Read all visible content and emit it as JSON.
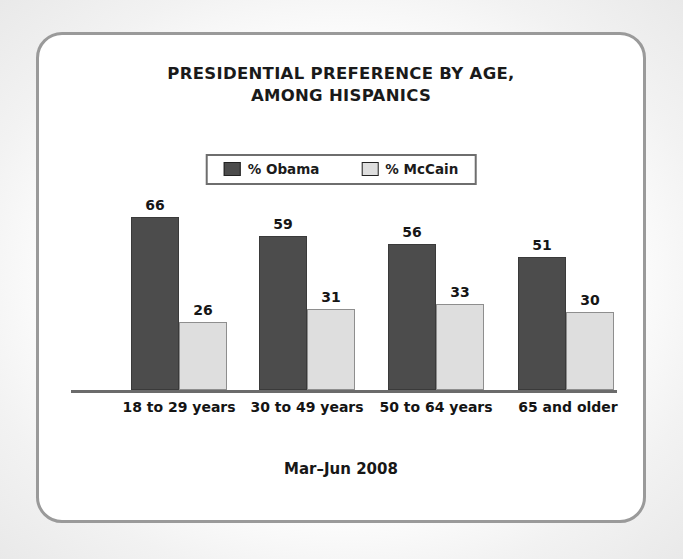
{
  "chart_data": {
    "type": "bar",
    "title": "PRESIDENTIAL PREFERENCE BY AGE, AMONG HISPANICS",
    "title_lines": [
      "PRESIDENTIAL PREFERENCE BY AGE,",
      "AMONG HISPANICS"
    ],
    "subtitle": "",
    "footnote": "Mar–Jun 2008",
    "xlabel": "",
    "ylabel": "",
    "ylim": [
      0,
      70
    ],
    "grid": false,
    "legend_position": "top-center",
    "categories": [
      "18 to 29 years",
      "30 to 49 years",
      "50 to 64 years",
      "65 and older"
    ],
    "series": [
      {
        "name": "% Obama",
        "color": "#4c4c4c",
        "values": [
          66,
          59,
          56,
          51
        ]
      },
      {
        "name": "% McCain",
        "color": "#dedede",
        "values": [
          26,
          31,
          33,
          30
        ]
      }
    ],
    "data_labels": {
      "18 to 29 years": {
        "% Obama": 66,
        "% McCain": 26
      },
      "30 to 49 years": {
        "% Obama": 59,
        "% McCain": 31
      },
      "50 to 64 years": {
        "% Obama": 56,
        "% McCain": 33
      },
      "65 and older": {
        "% Obama": 51,
        "% McCain": 30
      }
    }
  },
  "colors": {
    "obama_bar": "#4c4c4c",
    "mccain_bar": "#dedede",
    "axis": "#6b6b6b",
    "frame_border": "#9a9a9a",
    "legend_border": "#6e6e6e",
    "text": "#161616",
    "card_background": "#ffffff"
  }
}
